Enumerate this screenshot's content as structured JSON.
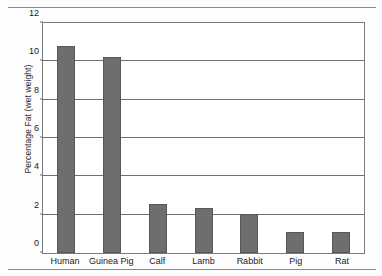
{
  "chart_data": {
    "type": "bar",
    "title": "",
    "xlabel": "",
    "ylabel": "Percentage Fat (wet weight)",
    "categories": [
      "Human",
      "Guinea Pig",
      "Calf",
      "Lamb",
      "Rabbit",
      "Pig",
      "Rat"
    ],
    "values": [
      10.7,
      10.15,
      2.55,
      2.35,
      2.0,
      1.1,
      1.1
    ],
    "ylim": [
      0,
      12
    ],
    "yticks": [
      0,
      2,
      4,
      6,
      8,
      10,
      12
    ],
    "ytick_labels": [
      "0",
      "2",
      "4",
      "6",
      "8",
      "10",
      "12"
    ],
    "grid": "horizontal",
    "legend": "none",
    "bar_color": "#6e6e6e",
    "bar_edge_color": "#575757",
    "axis_color": "#7b7b7b",
    "background_color": "#ffffff"
  },
  "figure": {
    "page_rule_color": "#8a8a8a"
  }
}
